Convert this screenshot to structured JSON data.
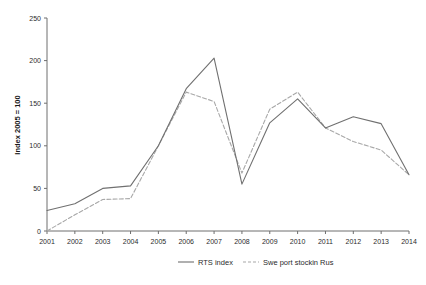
{
  "chart_data": {
    "type": "line",
    "title": "",
    "subtitle": "",
    "xlabel": "",
    "ylabel": "Index 2005 = 100",
    "categories": [
      "2001",
      "2002",
      "2003",
      "2004",
      "2005",
      "2006",
      "2007",
      "2008",
      "2009",
      "2010",
      "2011",
      "2012",
      "2013",
      "2014"
    ],
    "x": [
      2001,
      2002,
      2003,
      2004,
      2005,
      2006,
      2007,
      2008,
      2009,
      2010,
      2011,
      2012,
      2013,
      2014
    ],
    "ylim": [
      0,
      250
    ],
    "yticks": [
      0,
      50,
      100,
      150,
      200,
      250
    ],
    "xlim": [
      2001,
      2014
    ],
    "grid": false,
    "legend_position": "bottom",
    "series": [
      {
        "name": "RTS index",
        "style": "solid",
        "color": "#707070",
        "values": [
          24,
          32,
          50,
          53,
          100,
          167,
          203,
          55,
          127,
          155,
          121,
          134,
          126,
          66
        ]
      },
      {
        "name": "Swe port stockin Rus",
        "style": "dashed",
        "color": "#a8a8a8",
        "values": [
          0,
          19,
          37,
          38,
          100,
          163,
          152,
          68,
          143,
          163,
          121,
          105,
          95,
          66
        ]
      }
    ]
  },
  "axes": {
    "y_tick_labels": [
      "0",
      "50",
      "100",
      "150",
      "200",
      "250"
    ],
    "x_tick_labels": [
      "2001",
      "2002",
      "2003",
      "2004",
      "2005",
      "2006",
      "2007",
      "2008",
      "2009",
      "2010",
      "2011",
      "2012",
      "2013",
      "2014"
    ],
    "y_axis_title": "Index 2005 = 100"
  },
  "legend": {
    "entries": [
      {
        "label": "RTS index"
      },
      {
        "label": "Swe port stockin Rus"
      }
    ]
  }
}
